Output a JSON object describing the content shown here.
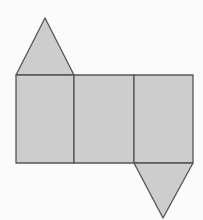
{
  "figure": {
    "title": "",
    "colors": {
      "background": "#fbfbfb",
      "fill": "#cdcdcd",
      "stroke": "#555555"
    },
    "faces": [
      {
        "id": "top-triangle",
        "type": "triangle",
        "points": [
          [
            45,
            18
          ],
          [
            16,
            75
          ],
          [
            74,
            75
          ]
        ]
      },
      {
        "id": "rect-left",
        "type": "rect",
        "x": 16,
        "y": 75,
        "w": 58,
        "h": 88
      },
      {
        "id": "rect-middle",
        "type": "rect",
        "x": 74,
        "y": 75,
        "w": 60,
        "h": 88
      },
      {
        "id": "rect-right",
        "type": "rect",
        "x": 134,
        "y": 75,
        "w": 59,
        "h": 88
      },
      {
        "id": "bottom-triangle",
        "type": "triangle",
        "points": [
          [
            134,
            163
          ],
          [
            193,
            163
          ],
          [
            163,
            218
          ]
        ]
      }
    ]
  }
}
